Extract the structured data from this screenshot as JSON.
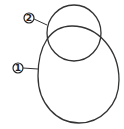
{
  "diagram": {
    "stroke_color": "#333333",
    "background": "#ffffff",
    "shapes": [
      {
        "id": "large-ellipse",
        "label": "1",
        "description": "large egg-shaped oval"
      },
      {
        "id": "small-circle",
        "label": "2",
        "description": "smaller circle overlapping top of oval"
      }
    ],
    "labels": {
      "one": "1",
      "two": "2"
    }
  }
}
